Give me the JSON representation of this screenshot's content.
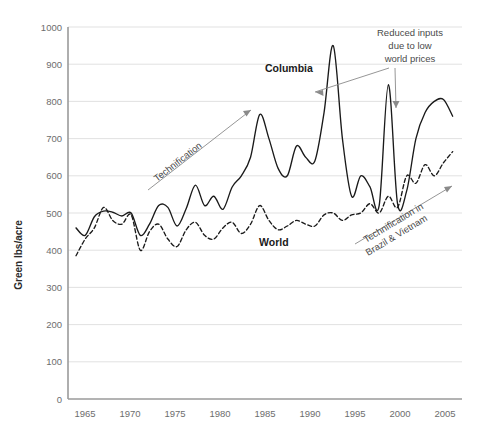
{
  "chart_data": {
    "type": "line",
    "title": "",
    "xlabel": "",
    "ylabel": "Green lbs/acre",
    "xlim": [
      1964,
      2005
    ],
    "ylim": [
      0,
      1000
    ],
    "grid": true,
    "legend_position": "inline-labels",
    "x_ticks": [
      "1965",
      "1970",
      "1975",
      "1980",
      "1985",
      "1990",
      "1995",
      "2000",
      "2005"
    ],
    "y_ticks": [
      "0",
      "100",
      "200",
      "300",
      "400",
      "500",
      "600",
      "700",
      "800",
      "900",
      "1000"
    ],
    "x": [
      1964,
      1965,
      1966,
      1967,
      1968,
      1969,
      1970,
      1971,
      1972,
      1973,
      1974,
      1975,
      1976,
      1977,
      1978,
      1979,
      1980,
      1981,
      1982,
      1983,
      1984,
      1985,
      1986,
      1987,
      1988,
      1989,
      1990,
      1991,
      1992,
      1993,
      1994,
      1995,
      1996,
      1997,
      1998,
      1999,
      2000,
      2001,
      2002,
      2003,
      2004,
      2005
    ],
    "series": [
      {
        "name": "Columbia",
        "style": "solid",
        "values": [
          460,
          440,
          490,
          505,
          502,
          492,
          500,
          440,
          470,
          520,
          515,
          465,
          512,
          575,
          520,
          545,
          510,
          570,
          600,
          650,
          765,
          700,
          620,
          600,
          680,
          650,
          640,
          770,
          950,
          700,
          545,
          600,
          570,
          520,
          845,
          525,
          560,
          700,
          770,
          800,
          805,
          760
        ]
      },
      {
        "name": "World",
        "style": "dashed",
        "values": [
          385,
          430,
          460,
          515,
          480,
          470,
          495,
          400,
          450,
          470,
          430,
          410,
          455,
          475,
          440,
          430,
          460,
          475,
          445,
          470,
          520,
          480,
          455,
          465,
          480,
          470,
          465,
          495,
          500,
          480,
          495,
          500,
          525,
          500,
          545,
          515,
          600,
          580,
          630,
          600,
          635,
          665
        ]
      }
    ],
    "annotations": [
      {
        "id": "technification",
        "text": "Technification"
      },
      {
        "id": "reduced-inputs",
        "lines": [
          "Reduced inputs",
          "due to low",
          "world prices"
        ]
      },
      {
        "id": "technification-brazil-vietnam",
        "lines": [
          "Technification in",
          "Brazil & Vietnam"
        ]
      }
    ],
    "series_labels": {
      "columbia": "Columbia",
      "world": "World"
    },
    "colors": {
      "line": "#1a1a1a",
      "grid": "#d9d9d9",
      "axis": "#9a9a9a",
      "tick_text": "#6d6d6d",
      "annotation": "#4a4a4a"
    }
  }
}
